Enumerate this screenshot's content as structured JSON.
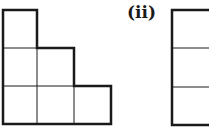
{
  "figures": [
    {
      "id": "i",
      "label": "",
      "shape": "staircase",
      "cells": [
        [
          0,
          0
        ],
        [
          0,
          1
        ],
        [
          1,
          1
        ],
        [
          0,
          2
        ],
        [
          1,
          2
        ],
        [
          2,
          2
        ]
      ],
      "columns": 3,
      "rows": 3
    },
    {
      "id": "ii",
      "label": "(ii)",
      "shape": "column",
      "cells": [
        [
          0,
          0
        ],
        [
          0,
          1
        ],
        [
          0,
          2
        ]
      ],
      "columns": 1,
      "rows": 3
    }
  ],
  "colors": {
    "stroke": "#1a1a1a",
    "background": "#ffffff"
  }
}
